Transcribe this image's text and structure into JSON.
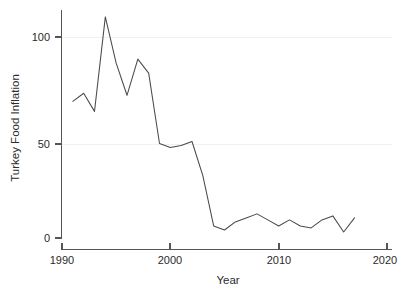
{
  "chart_data": {
    "type": "line",
    "title": "",
    "subtitle": "",
    "xlabel": "Year",
    "ylabel": "Turkey Food Inflation",
    "xlim": [
      1990,
      2020
    ],
    "ylim": [
      0,
      115
    ],
    "xticks": [
      1990,
      2000,
      2010,
      2020
    ],
    "xtick_labels": [
      "1990",
      "2000",
      "2010",
      "2020"
    ],
    "yticks": [
      0,
      50,
      100
    ],
    "ytick_labels": [
      "0",
      "50",
      "100"
    ],
    "grid": "horizontal-faint",
    "legend": "none",
    "line_color": "#4a4a4a",
    "axis_color": "#555555",
    "grid_color": "#f1f1f1",
    "x": [
      1991,
      1992,
      1993,
      1994,
      1995,
      1996,
      1997,
      1998,
      1999,
      2000,
      2001,
      2002,
      2003,
      2004,
      2005,
      2006,
      2007,
      2008,
      2009,
      2010,
      2011,
      2012,
      2013,
      2014,
      2015,
      2016,
      2017
    ],
    "values": [
      68,
      72,
      63,
      110,
      87,
      71,
      89,
      82,
      47,
      45,
      46,
      48,
      31,
      6,
      4,
      8,
      10,
      12,
      9,
      6,
      9,
      6,
      5,
      9,
      11,
      3,
      10
    ],
    "series": [
      {
        "name": "Turkey Food Inflation",
        "x": [
          1991,
          1992,
          1993,
          1994,
          1995,
          1996,
          1997,
          1998,
          1999,
          2000,
          2001,
          2002,
          2003,
          2004,
          2005,
          2006,
          2007,
          2008,
          2009,
          2010,
          2011,
          2012,
          2013,
          2014,
          2015,
          2016,
          2017
        ],
        "values": [
          68,
          72,
          63,
          110,
          87,
          71,
          89,
          82,
          47,
          45,
          46,
          48,
          31,
          6,
          4,
          8,
          10,
          12,
          9,
          6,
          9,
          6,
          5,
          9,
          11,
          3,
          10
        ]
      }
    ]
  },
  "axes": {
    "x_title": "Year",
    "y_title": "Turkey Food Inflation",
    "x_tick_labels": [
      "1990",
      "2000",
      "2010",
      "2020"
    ],
    "y_tick_labels": [
      "100",
      "50",
      "0"
    ]
  }
}
